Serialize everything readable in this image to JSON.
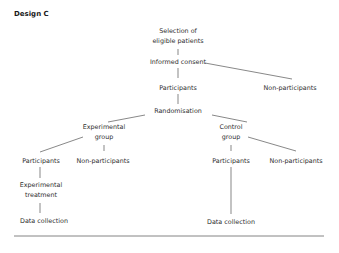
{
  "title": "Design C",
  "nodes": {
    "selection_line1": "Selection of",
    "selection_line2": "eligible patients",
    "informed_consent": "Informed consent",
    "participants_top": "Participants",
    "non_participants_top": "Non-participants",
    "randomisation": "Randomisation",
    "experimental_group_line1": "Experimental",
    "experimental_group_line2": "group",
    "control_group_line1": "Control",
    "control_group_line2": "group",
    "exp_participants": "Participants",
    "exp_non_participants": "Non-participants",
    "ctrl_participants": "Participants",
    "ctrl_non_participants": "Non-participants",
    "experimental_treatment_line1": "Experimental",
    "experimental_treatment_line2": "treatment",
    "exp_data_collection": "Data collection",
    "ctrl_data_collection": "Data collection"
  },
  "colors": {
    "text": "#2e2e2e",
    "lines": "#555555",
    "background": "#ffffff"
  }
}
